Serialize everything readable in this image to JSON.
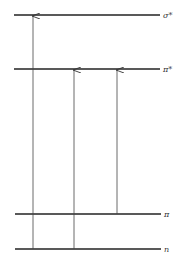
{
  "diagram": {
    "type": "energy-level-diagram",
    "levels": [
      {
        "id": "sigma_star",
        "label": "σ*",
        "y": 15
      },
      {
        "id": "pi_star",
        "label": "π*",
        "y": 69
      },
      {
        "id": "pi",
        "label": "π",
        "y": 214
      },
      {
        "id": "n",
        "label": "n",
        "y": 249
      }
    ],
    "transitions": [
      {
        "id": "n_to_sigma_star",
        "from": "n",
        "to": "sigma_star",
        "x": 33
      },
      {
        "id": "n_to_pi_star",
        "from": "n",
        "to": "pi_star",
        "x": 74
      },
      {
        "id": "pi_to_pi_star",
        "from": "pi",
        "to": "pi_star",
        "x": 117
      }
    ],
    "line_x_start": 14,
    "line_x_end": 160,
    "colors": {
      "line": "#222222",
      "arrow": "#444444",
      "background": "#ffffff"
    }
  }
}
